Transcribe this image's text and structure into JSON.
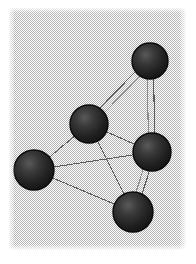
{
  "figure": {
    "canvas": {
      "width": 196,
      "height": 264
    },
    "panel": {
      "x": 9,
      "y": 8,
      "width": 177,
      "height": 242
    }
  },
  "colors": {
    "page_background": "#ffffff",
    "panel_background": "#c8c8c8",
    "panel_dither": "#b4b4b4",
    "node_fill": "#1e1e1e",
    "node_fill_dither": "#3c3c3c",
    "node_highlight": "#565656",
    "node_rim": "#0a0a0a",
    "edge_stroke": "#5a5a5a",
    "edge_stroke_light": "#8c8c8c"
  },
  "chart_data": {
    "type": "scatter",
    "title": "",
    "xlabel": "",
    "ylabel": "",
    "grid": false,
    "legend": false,
    "nodes": [
      {
        "id": "n1",
        "label": "top-right node",
        "cx": 150,
        "cy": 61,
        "r": 18
      },
      {
        "id": "n2",
        "label": "upper-middle node",
        "cx": 89,
        "cy": 124,
        "r": 19
      },
      {
        "id": "n3",
        "label": "right-middle node",
        "cx": 152,
        "cy": 152,
        "r": 19
      },
      {
        "id": "n4",
        "label": "far-left node",
        "cx": 34,
        "cy": 170,
        "r": 20
      },
      {
        "id": "n5",
        "label": "bottom node",
        "cx": 133,
        "cy": 212,
        "r": 20
      }
    ],
    "edges": [
      {
        "source": "n2",
        "target": "n1",
        "style": "double"
      },
      {
        "source": "n1",
        "target": "n3",
        "style": "double"
      },
      {
        "source": "n3",
        "target": "n5",
        "style": "double"
      },
      {
        "source": "n2",
        "target": "n3",
        "style": "single"
      },
      {
        "source": "n2",
        "target": "n5",
        "style": "single"
      },
      {
        "source": "n2",
        "target": "n4",
        "style": "single"
      },
      {
        "source": "n4",
        "target": "n3",
        "style": "single"
      },
      {
        "source": "n4",
        "target": "n5",
        "style": "single"
      }
    ],
    "node_count": 5,
    "edge_count": 8
  }
}
